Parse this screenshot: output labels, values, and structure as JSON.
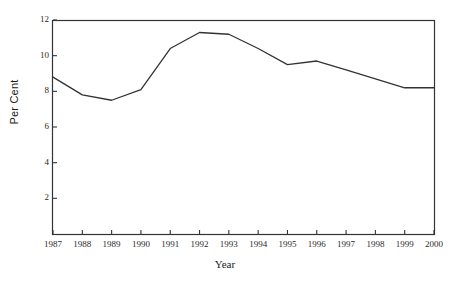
{
  "chart_data": {
    "type": "line",
    "title": "",
    "xlabel": "Year",
    "ylabel": "Per Cent",
    "categories": [
      "1987",
      "1988",
      "1989",
      "1990",
      "1991",
      "1992",
      "1993",
      "1994",
      "1995",
      "1996",
      "1997",
      "1998",
      "1999",
      "2000"
    ],
    "x": [
      1987,
      1988,
      1989,
      1990,
      1991,
      1992,
      1993,
      1994,
      1995,
      1996,
      1997,
      1998,
      1999,
      2000
    ],
    "values": [
      8.8,
      7.8,
      7.5,
      8.1,
      10.4,
      11.3,
      11.2,
      10.4,
      9.5,
      9.7,
      9.2,
      8.7,
      8.2,
      8.2
    ],
    "series": [
      {
        "name": "Per Cent",
        "values": [
          8.8,
          7.8,
          7.5,
          8.1,
          10.4,
          11.3,
          11.2,
          10.4,
          9.5,
          9.7,
          9.2,
          8.7,
          8.2,
          8.2
        ]
      }
    ],
    "xlim": [
      1987,
      2000
    ],
    "ylim": [
      0,
      12
    ],
    "ytick_labels": [
      "2",
      "4",
      "6",
      "8",
      "10",
      "12"
    ],
    "ytick_values": [
      2,
      4,
      6,
      8,
      10,
      12
    ],
    "xtick_labels": [
      "1987",
      "1988",
      "1989",
      "1990",
      "1991",
      "1992",
      "1993",
      "1994",
      "1995",
      "1996",
      "1997",
      "1998",
      "1999",
      "2000"
    ],
    "grid": false,
    "legend": false,
    "legend_position": "none",
    "line_color": "#333333",
    "axis_color": "#333333",
    "background_color": "#ffffff"
  }
}
